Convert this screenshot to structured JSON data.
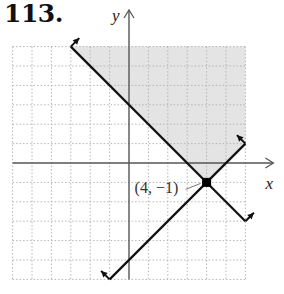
{
  "problem_number": "113.",
  "chart_data": {
    "type": "line",
    "title": "113.",
    "xlabel": "x",
    "ylabel": "y",
    "xlim": [
      -6,
      6
    ],
    "ylim": [
      -6,
      6
    ],
    "grid": true,
    "grid_style": "dotted",
    "series": [
      {
        "name": "boundary-1",
        "equation": "y = -x + 3",
        "points": [
          [
            -3,
            6
          ],
          [
            6,
            -3
          ]
        ]
      },
      {
        "name": "boundary-2",
        "equation": "y = x - 5",
        "points": [
          [
            -1,
            -6
          ],
          [
            6,
            1
          ]
        ]
      }
    ],
    "shaded_region": {
      "description": "region above both lines (y >= -x + 3 and y >= x - 5)",
      "vertices": [
        [
          -3,
          6
        ],
        [
          6,
          6
        ],
        [
          6,
          1
        ],
        [
          4,
          -1
        ]
      ],
      "color": "#e4e4e4"
    },
    "annotations": [
      {
        "label": "(4, −1)",
        "point": [
          4,
          -1
        ],
        "marker": "filled-square"
      }
    ]
  },
  "labels": {
    "x_axis": "x",
    "y_axis": "y",
    "vertex": "(4, −1)"
  },
  "colors": {
    "line": "#111111",
    "axis": "#555555",
    "grid": "#b5b5b5",
    "shade": "#e4e4e4"
  }
}
